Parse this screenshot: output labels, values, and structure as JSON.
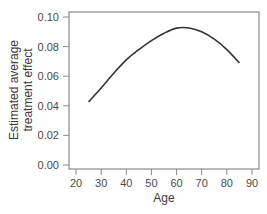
{
  "chart_data": {
    "type": "line",
    "title": "",
    "xlabel": "Age",
    "ylabel": [
      "Estimated average",
      "treatment effect"
    ],
    "xlim": [
      17.3,
      93
    ],
    "ylim": [
      -0.003,
      0.103
    ],
    "x_ticks": [
      20,
      30,
      40,
      50,
      60,
      70,
      80,
      90
    ],
    "y_ticks": [
      0.0,
      0.02,
      0.04,
      0.06,
      0.08,
      0.1
    ],
    "y_tick_labels": [
      "0.00",
      "0.02",
      "0.04",
      "0.06",
      "0.08",
      "0.10"
    ],
    "grid": false,
    "legend": null,
    "series": [
      {
        "name": "Estimated average treatment effect",
        "x": [
          25,
          30,
          35,
          40,
          45,
          50,
          55,
          60,
          65,
          70,
          75,
          80,
          85
        ],
        "y": [
          0.0426,
          0.052,
          0.062,
          0.071,
          0.078,
          0.084,
          0.089,
          0.0925,
          0.0926,
          0.09,
          0.085,
          0.078,
          0.069
        ]
      }
    ]
  },
  "colors": {
    "line": "#333333",
    "frame": "#8a8a8a",
    "text": "#4a4a4a"
  }
}
